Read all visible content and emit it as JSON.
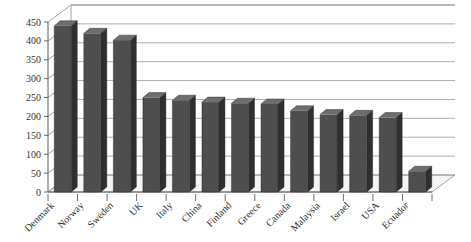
{
  "chart_data": {
    "type": "bar",
    "title": "",
    "subtitle": "",
    "xlabel": "",
    "ylabel": "",
    "categories": [
      "Denmark",
      "Norway",
      "Sweden",
      "UK",
      "Italy",
      "China",
      "Finland",
      "Greece",
      "Canada",
      "Malaysia",
      "Israel",
      "USA",
      "Ecuador"
    ],
    "values": [
      440,
      420,
      402,
      250,
      243,
      238,
      235,
      233,
      215,
      205,
      203,
      197,
      55
    ],
    "ylim": [
      0,
      450
    ],
    "yticks": [
      0,
      50,
      100,
      150,
      200,
      250,
      300,
      350,
      400,
      450
    ],
    "ytick_labels": [
      "0",
      "50",
      "100",
      "150",
      "200",
      "250",
      "300",
      "350",
      "400",
      "450"
    ],
    "grid": true,
    "legend": false,
    "legend_position": "none",
    "series": [
      {
        "name": "",
        "values": [
          440,
          420,
          402,
          250,
          243,
          238,
          235,
          233,
          215,
          205,
          203,
          197,
          55
        ],
        "color": "#4e4e4e"
      }
    ],
    "style": {
      "three_d": true,
      "bar_face_color": "#4e4e4e",
      "bar_side_color": "#2f2f2f",
      "bar_top_color": "#6d6d6d",
      "gridline_color": "#9a9a9a",
      "axis_color": "#5d5d5d",
      "background": "#ffffff",
      "xlabel_rotation": -45
    }
  }
}
